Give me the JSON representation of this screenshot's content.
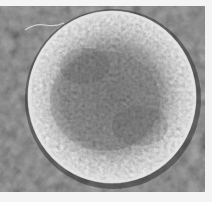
{
  "image": {
    "kind": "grayscale scanning electron micrograph",
    "subject": "textured spherical particle",
    "alt": "SEM micrograph of a rough, roughly spherical particle on a dark mottled background with a thin fiber at upper left",
    "colors": {
      "margin": "#f4f4f4",
      "background_dark": "#3c3c3c",
      "background_mid": "#555555",
      "sphere_rim": "#e2e2e2",
      "sphere_mid": "#b4b4b4",
      "sphere_core": "#8c8c8c",
      "fiber": "#d8d8d8"
    },
    "frame": {
      "x": 0,
      "y": 6,
      "width": 205,
      "height": 186
    },
    "sphere": {
      "cx": 112,
      "cy": 91,
      "rx": 84,
      "ry": 86
    },
    "fiber": {
      "from": [
        25,
        22
      ],
      "to": [
        64,
        17
      ]
    }
  }
}
